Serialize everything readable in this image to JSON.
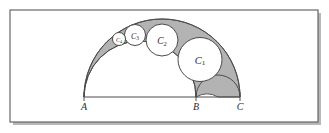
{
  "figure": {
    "kind": "arbelos-pappus-chain",
    "background_color": "#ffffff",
    "frame": {
      "stroke_color": "#5a5a5a",
      "shadow_color": "#b8b8b8",
      "x": 10,
      "y": 10,
      "width": 308,
      "height": 112
    },
    "shading": {
      "fill_color": "#9d9d9d",
      "stroke_color": "#4a4a4a",
      "description": "arbelos region shaded gray"
    },
    "baseline": {
      "y": 97,
      "stroke_color": "#4a4a4a",
      "from_x": 84,
      "to_x": 240
    },
    "points": [
      {
        "id": "A",
        "label": "A",
        "x": 84,
        "y": 97,
        "label_y": 110
      },
      {
        "id": "B",
        "label": "B",
        "x": 196,
        "y": 97,
        "label_y": 110
      },
      {
        "id": "C",
        "label": "C",
        "x": 240,
        "y": 97,
        "label_y": 110
      }
    ],
    "semicircles": [
      {
        "id": "outer-AC",
        "name": "semicircle-AC",
        "center_x": 162,
        "radius": 78
      },
      {
        "id": "inner-AB",
        "name": "semicircle-AB",
        "center_x": 140,
        "radius": 56
      },
      {
        "id": "inner-BC",
        "name": "semicircle-BC",
        "center_x": 218,
        "radius": 22
      }
    ],
    "chain_circles": [
      {
        "id": "C1",
        "label": "C",
        "subscript": "1",
        "cx": 200.0,
        "cy": 59.5,
        "r": 22.0,
        "label_font_size": 10.5
      },
      {
        "id": "C2",
        "label": "C",
        "subscript": "2",
        "cx": 162.0,
        "cy": 40.0,
        "r": 16.0,
        "label_font_size": 9.5
      },
      {
        "id": "C3",
        "label": "C",
        "subscript": "3",
        "cx": 135.0,
        "cy": 35.0,
        "r": 10.5,
        "label_font_size": 8.0
      },
      {
        "id": "C4",
        "label": "C",
        "subscript": "4",
        "cx": 119.0,
        "cy": 39.0,
        "r": 6.5,
        "label_font_size": 6.2
      }
    ]
  }
}
